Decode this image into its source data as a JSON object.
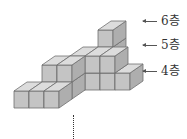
{
  "figure": {
    "colors": {
      "top": "#dcdcdc",
      "front": "#c4c4c4",
      "side": "#aeaeae",
      "edge": "#6e6e6e"
    }
  },
  "layer_labels": [
    {
      "text": "6층",
      "arrow": "left-arrow"
    },
    {
      "text": "5층",
      "arrow": "left-arrow"
    },
    {
      "text": "4층",
      "arrow": "left-arrow"
    }
  ],
  "continuation_marker": "vertical-dotted-line"
}
